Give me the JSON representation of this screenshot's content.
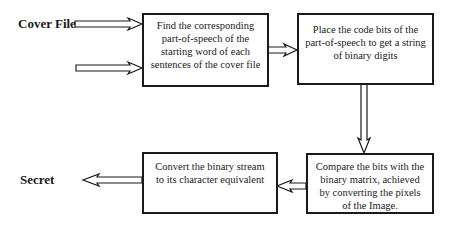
{
  "labels": {
    "cover_file": "Cover File",
    "secret": "Secret"
  },
  "boxes": {
    "find_pos": "Find the corresponding part-of-speech of the starting word of each sentences of the cover file",
    "place_bits": "Place the code bits of the part-of-speech to get a string of binary digits",
    "compare_bits": "Compare the bits with the binary matrix, achieved by converting the pixels of the Image.",
    "convert_stream": "Convert the binary stream to its character equivalent"
  },
  "colors": {
    "stroke": "#1a1a1a",
    "background": "#ffffff"
  }
}
